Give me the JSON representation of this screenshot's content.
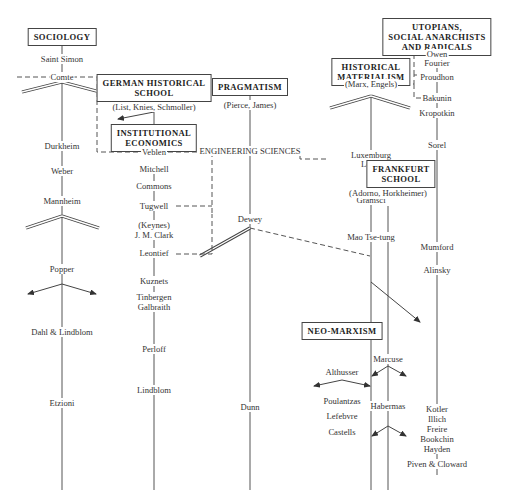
{
  "schools": {
    "sociology": "SOCIOLOGY",
    "german_historical": [
      "GERMAN HISTORICAL",
      "SCHOOL"
    ],
    "institutional": [
      "INSTITUTIONAL",
      "ECONOMICS"
    ],
    "pragmatism": "PRAGMATISM",
    "historical_materialism": [
      "HISTORICAL",
      "MATERIALISM"
    ],
    "utopians": [
      "UTOPIANS,",
      "SOCIAL ANARCHISTS",
      "AND RADICALS"
    ],
    "frankfurt": [
      "FRANKFURT",
      "SCHOOL"
    ],
    "neo_marxism": "NEO-MARXISM"
  },
  "labels": {
    "engineering_sciences": "ENGINEERING SCIENCES",
    "sociology_column": [
      "Saint Simon",
      "Comte",
      "Durkheim",
      "Weber",
      "Mannheim",
      "Popper",
      "Dahl & Lindblom",
      "Etzioni"
    ],
    "german_members": "(List, Knies, Schmoller)",
    "institutional_column": [
      "Veblen",
      "Mitchell",
      "Commons",
      "Tugwell",
      "(Keynes)",
      "J. M. Clark",
      "Leontief",
      "Kuznets",
      "Tinbergen",
      "Galbraith",
      "Perloff",
      "Lindblom"
    ],
    "pragmatism_members": "(Pierce, James)",
    "pragmatism_column": [
      "Dewey",
      "Dunn"
    ],
    "marx_members": "(Marx, Engels)",
    "marxism_column": [
      "Luxemburg",
      "Lenin",
      "Gramsci",
      "Mao Tse-tung"
    ],
    "frankfurt_members": "(Adorno, Horkheimer)",
    "utopians_column": [
      "Owen",
      "Fourier",
      "Proudhon",
      "Bakunin",
      "Kropotkin",
      "Sorel",
      "Mumford",
      "Alinsky"
    ],
    "neo_marxism_column": [
      "Althusser",
      "Poulantzas",
      "Lefebvre",
      "Castells"
    ],
    "frankfurt_column": [
      "Marcuse",
      "Habermas"
    ],
    "radicals_column": [
      "Kotler",
      "Illich",
      "Freire",
      "Bookchin",
      "Hayden",
      "Piven & Cloward"
    ]
  }
}
